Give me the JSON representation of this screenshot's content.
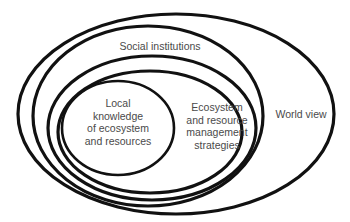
{
  "diagram": {
    "type": "nested-ellipses",
    "stroke_color": "#111111",
    "text_color": "#4a4a4a",
    "background": "#ffffff",
    "layers": [
      {
        "id": "world-view",
        "label_lines": [
          "World view"
        ]
      },
      {
        "id": "social-institutions",
        "label_lines": [
          "Social institutions"
        ]
      },
      {
        "id": "ecosystem-management",
        "label_lines": [
          "Ecosystem",
          "and resource",
          "management",
          "strategies"
        ]
      },
      {
        "id": "local-knowledge",
        "label_lines": [
          "Local",
          "knowledge",
          "of ecosystem",
          "and resources"
        ]
      }
    ]
  }
}
